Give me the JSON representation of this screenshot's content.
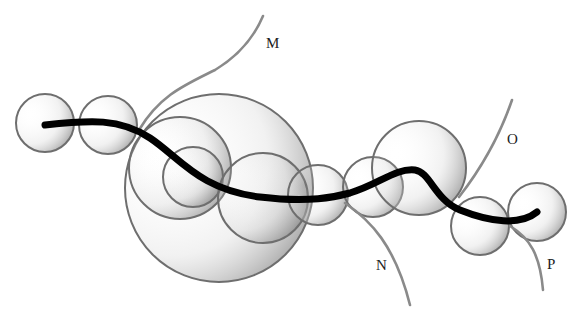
{
  "diagram": {
    "type": "curve-with-osculating-circles",
    "labels": [
      {
        "id": "M",
        "text": "M",
        "x": 266,
        "y": 35
      },
      {
        "id": "N",
        "text": "N",
        "x": 376,
        "y": 257
      },
      {
        "id": "O",
        "text": "O",
        "x": 507,
        "y": 131
      },
      {
        "id": "P",
        "text": "P",
        "x": 547,
        "y": 256
      }
    ],
    "colors": {
      "main_curve": "#000000",
      "branch_curve": "#8a8a8a",
      "circle_stroke": "#6e6e6e",
      "circle_fill_dark": "#9a9a9a",
      "background": "#ffffff"
    },
    "circles": [
      {
        "cx": 45,
        "cy": 123,
        "r": 29
      },
      {
        "cx": 108,
        "cy": 125,
        "r": 29
      },
      {
        "cx": 219,
        "cy": 188,
        "r": 94
      },
      {
        "cx": 180,
        "cy": 168,
        "r": 51
      },
      {
        "cx": 193,
        "cy": 177,
        "r": 30
      },
      {
        "cx": 263,
        "cy": 198,
        "r": 45
      },
      {
        "cx": 318,
        "cy": 195,
        "r": 30
      },
      {
        "cx": 373,
        "cy": 187,
        "r": 30
      },
      {
        "cx": 419,
        "cy": 168,
        "r": 47
      },
      {
        "cx": 480,
        "cy": 226,
        "r": 29
      },
      {
        "cx": 537,
        "cy": 212,
        "r": 29
      }
    ]
  }
}
